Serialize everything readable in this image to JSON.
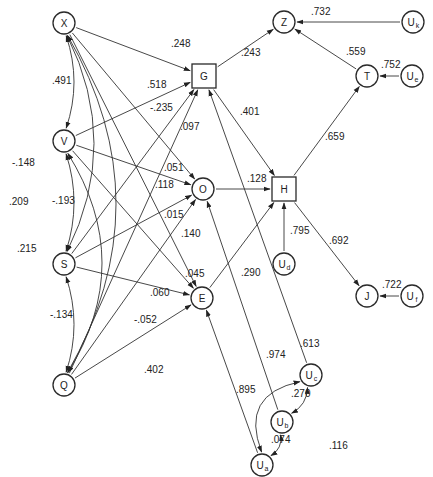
{
  "diagram": {
    "type": "path-diagram",
    "nodes": [
      {
        "id": "X",
        "label": "X",
        "sub": "",
        "shape": "circle",
        "x": 64,
        "y": 23
      },
      {
        "id": "V",
        "label": "V",
        "sub": "",
        "shape": "circle",
        "x": 64,
        "y": 141
      },
      {
        "id": "S",
        "label": "S",
        "sub": "",
        "shape": "circle",
        "x": 64,
        "y": 264
      },
      {
        "id": "Q",
        "label": "Q",
        "sub": "",
        "shape": "circle",
        "x": 64,
        "y": 385
      },
      {
        "id": "G",
        "label": "G",
        "sub": "",
        "shape": "square",
        "x": 204,
        "y": 76
      },
      {
        "id": "O",
        "label": "O",
        "sub": "",
        "shape": "circle",
        "x": 203,
        "y": 189
      },
      {
        "id": "E",
        "label": "E",
        "sub": "",
        "shape": "circle",
        "x": 202,
        "y": 298
      },
      {
        "id": "H",
        "label": "H",
        "sub": "",
        "shape": "square",
        "x": 284,
        "y": 189
      },
      {
        "id": "Z",
        "label": "Z",
        "sub": "",
        "shape": "circle",
        "x": 284,
        "y": 22
      },
      {
        "id": "Uk",
        "label": "U",
        "sub": "k",
        "shape": "circle",
        "x": 413,
        "y": 22
      },
      {
        "id": "T",
        "label": "T",
        "sub": "",
        "shape": "circle",
        "x": 367,
        "y": 76
      },
      {
        "id": "Ue",
        "label": "U",
        "sub": "e",
        "shape": "circle",
        "x": 412,
        "y": 76
      },
      {
        "id": "Ud",
        "label": "U",
        "sub": "d",
        "shape": "circle",
        "x": 284,
        "y": 264
      },
      {
        "id": "J",
        "label": "J",
        "sub": "",
        "shape": "circle",
        "x": 367,
        "y": 296
      },
      {
        "id": "Uf",
        "label": "U",
        "sub": "f",
        "shape": "circle",
        "x": 412,
        "y": 296
      },
      {
        "id": "Uc",
        "label": "U",
        "sub": "c",
        "shape": "circle",
        "x": 311,
        "y": 375
      },
      {
        "id": "Ub",
        "label": "U",
        "sub": "b",
        "shape": "circle",
        "x": 282,
        "y": 422
      },
      {
        "id": "Ua",
        "label": "U",
        "sub": "a",
        "shape": "circle",
        "x": 262,
        "y": 465
      }
    ],
    "paths": [
      {
        "from": "X",
        "to": "G",
        "coef": ".248",
        "lx": 171,
        "ly": 47
      },
      {
        "from": "V",
        "to": "G",
        "coef": ".518",
        "lx": 147,
        "ly": 88
      },
      {
        "from": "X",
        "to": "O",
        "coef": "-.235",
        "lx": 150,
        "ly": 111
      },
      {
        "from": "S",
        "to": "G",
        "coef": ".097",
        "lx": 180,
        "ly": 130
      },
      {
        "from": "V",
        "to": "O",
        "coef": ".051",
        "lx": 164,
        "ly": 171
      },
      {
        "from": "Q",
        "to": "G",
        "coef": ".118",
        "lx": 155,
        "ly": 188
      },
      {
        "from": "S",
        "to": "O",
        "coef": ".015",
        "lx": 164,
        "ly": 218
      },
      {
        "from": "Q",
        "to": "O",
        "coef": ".140",
        "lx": 181,
        "ly": 237
      },
      {
        "from": "X",
        "to": "E",
        "coef": ".045",
        "lx": 185,
        "ly": 277
      },
      {
        "from": "V",
        "to": "E",
        "coef": ".060",
        "lx": 150,
        "ly": 296
      },
      {
        "from": "S",
        "to": "E",
        "coef": "-.052",
        "lx": 134,
        "ly": 323
      },
      {
        "from": "Q",
        "to": "E",
        "coef": ".402",
        "lx": 144,
        "ly": 373
      },
      {
        "from": "G",
        "to": "Z",
        "coef": ".243",
        "lx": 241,
        "ly": 56
      },
      {
        "from": "G",
        "to": "H",
        "coef": ".401",
        "lx": 240,
        "ly": 115
      },
      {
        "from": "O",
        "to": "H",
        "coef": ".128",
        "lx": 247,
        "ly": 182
      },
      {
        "from": "E",
        "to": "H",
        "coef": ".290",
        "lx": 241,
        "ly": 276
      },
      {
        "from": "H",
        "to": "T",
        "coef": ".659",
        "lx": 325,
        "ly": 140
      },
      {
        "from": "T",
        "to": "Z",
        "coef": ".559",
        "lx": 346,
        "ly": 55
      },
      {
        "from": "Uk",
        "to": "Z",
        "coef": ".732",
        "lx": 311,
        "ly": 15
      },
      {
        "from": "Ue",
        "to": "T",
        "coef": ".752",
        "lx": 381,
        "ly": 68
      },
      {
        "from": "Ud",
        "to": "H",
        "coef": ".795",
        "lx": 290,
        "ly": 234
      },
      {
        "from": "H",
        "to": "J",
        "coef": ".692",
        "lx": 329,
        "ly": 244
      },
      {
        "from": "Uf",
        "to": "J",
        "coef": ".722",
        "lx": 382,
        "ly": 288
      },
      {
        "from": "Uc",
        "to": "G",
        "coef": ".613",
        "lx": 300,
        "ly": 347
      },
      {
        "from": "Ub",
        "to": "O",
        "coef": ".974",
        "lx": 266,
        "ly": 358
      },
      {
        "from": "Ua",
        "to": "E",
        "coef": ".895",
        "lx": 236,
        "ly": 393
      }
    ],
    "correlations": [
      {
        "a": "X",
        "b": "V",
        "coef": ".491",
        "lx": 52,
        "ly": 84
      },
      {
        "a": "X",
        "b": "S",
        "coef": "-.148",
        "lx": 12,
        "ly": 166
      },
      {
        "a": "X",
        "b": "Q",
        "coef": ".209",
        "lx": 9,
        "ly": 205
      },
      {
        "a": "V",
        "b": "S",
        "coef": "-.193",
        "lx": 52,
        "ly": 204
      },
      {
        "a": "V",
        "b": "Q",
        "coef": ".215",
        "lx": 17,
        "ly": 252
      },
      {
        "a": "S",
        "b": "Q",
        "coef": "-.134",
        "lx": 50,
        "ly": 318
      },
      {
        "a": "Uc",
        "b": "Ub",
        "coef": ".270",
        "lx": 291,
        "ly": 397
      },
      {
        "a": "Ub",
        "b": "Ua",
        "coef": ".074",
        "lx": 271,
        "ly": 443
      },
      {
        "a": "Uc",
        "b": "Ua",
        "coef": ".116",
        "lx": 329,
        "ly": 449
      }
    ]
  }
}
